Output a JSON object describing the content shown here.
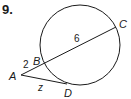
{
  "problem": {
    "number": "9."
  },
  "diagram": {
    "points": {
      "A": "A",
      "B": "B",
      "C": "C",
      "D": "D"
    },
    "lengths": {
      "AB": "2",
      "BC": "6",
      "AD": "z"
    },
    "colors": {
      "stroke": "#1a1a1a",
      "background": "#ffffff"
    }
  }
}
